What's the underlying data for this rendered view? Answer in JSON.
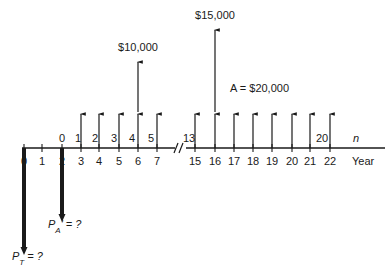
{
  "diagram": {
    "type": "cash-flow-diagram",
    "axis": {
      "y": 148,
      "x_start": 22,
      "x_end": 385,
      "label": "Year",
      "break_symbol": "//"
    },
    "year_ticks": [
      {
        "year": "0",
        "x": 24
      },
      {
        "year": "1",
        "x": 42
      },
      {
        "year": "2",
        "x": 62
      },
      {
        "year": "3",
        "x": 81
      },
      {
        "year": "4",
        "x": 99
      },
      {
        "year": "5",
        "x": 119
      },
      {
        "year": "6",
        "x": 138
      },
      {
        "year": "7",
        "x": 157
      },
      {
        "year": "15",
        "x": 195
      },
      {
        "year": "16",
        "x": 215
      },
      {
        "year": "17",
        "x": 234
      },
      {
        "year": "18",
        "x": 253
      },
      {
        "year": "19",
        "x": 272
      },
      {
        "year": "20",
        "x": 292
      },
      {
        "year": "21",
        "x": 310
      },
      {
        "year": "22",
        "x": 330
      }
    ],
    "n_labels": [
      {
        "text": "0",
        "x": 62
      },
      {
        "text": "1",
        "x": 78
      },
      {
        "text": "2",
        "x": 95
      },
      {
        "text": "3",
        "x": 114
      },
      {
        "text": "4",
        "x": 132
      },
      {
        "text": "5",
        "x": 151
      },
      {
        "text": "13",
        "x": 189
      },
      {
        "text": "20",
        "x": 322
      }
    ],
    "n_axis_label": "n",
    "annuity_arrows_x": [
      81,
      99,
      119,
      138,
      157,
      195,
      215,
      234,
      253,
      272,
      292,
      310,
      330
    ],
    "annuity_label": "A = $20,000",
    "big_arrows": [
      {
        "x": 138,
        "top": 62,
        "label": "$10,000"
      },
      {
        "x": 215,
        "top": 30,
        "label": "$15,000"
      }
    ],
    "down_arrows": [
      {
        "x": 24,
        "bottom": 255,
        "label_main": "P",
        "label_sub": "T",
        "label_rest": " = ?"
      },
      {
        "x": 62,
        "bottom": 222,
        "label_main": "P",
        "label_sub": "A",
        "label_rest": "' = ?"
      }
    ],
    "colors": {
      "ink": "#1a1a1a",
      "background": "#ffffff"
    }
  }
}
